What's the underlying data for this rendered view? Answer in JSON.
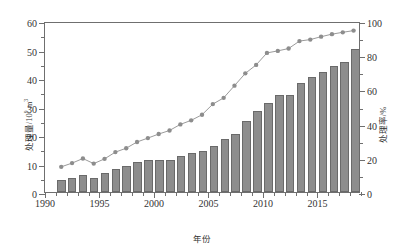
{
  "chart_data": {
    "type": "bar",
    "title": "",
    "xlabel": "年份",
    "ylabel": "处理量/10⁹ m³",
    "y2label": "处理率/%",
    "grid": false,
    "legend": "none",
    "xlim": [
      1990,
      2019
    ],
    "ylim": [
      0,
      60
    ],
    "y2lim": [
      0,
      100
    ],
    "ytick_labels": [
      "0",
      "10",
      "20",
      "30",
      "40",
      "50",
      "60"
    ],
    "ytick_values": [
      0,
      10,
      20,
      30,
      40,
      50,
      60
    ],
    "y2tick_labels": [
      "0",
      "20",
      "40",
      "60",
      "80",
      "100"
    ],
    "y2tick_values": [
      0,
      20,
      40,
      60,
      80,
      100
    ],
    "xtick_labels": [
      "1990",
      "1995",
      "2000",
      "2005",
      "2010",
      "2015"
    ],
    "xtick_values": [
      1990,
      1995,
      2000,
      2005,
      2010,
      2015
    ],
    "categories": [
      1991,
      1992,
      1993,
      1994,
      1995,
      1996,
      1997,
      1998,
      1999,
      2000,
      2001,
      2002,
      2003,
      2004,
      2005,
      2006,
      2007,
      2008,
      2009,
      2010,
      2011,
      2012,
      2013,
      2014,
      2015,
      2016,
      2017,
      2018
    ],
    "series": [
      {
        "name": "处理量",
        "type": "bar",
        "axis": "left",
        "unit": "10⁹ m³",
        "color": "#8d8d8d",
        "edge_color": "#6a6a6a",
        "values": [
          4.2,
          5.0,
          6.1,
          5.0,
          6.7,
          8.1,
          9.0,
          10.4,
          11.2,
          11.4,
          11.4,
          12.5,
          13.6,
          14.3,
          16.1,
          18.5,
          20.5,
          24.8,
          28.5,
          31.3,
          34.0,
          34.2,
          38.2,
          40.3,
          42.0,
          44.1,
          45.7,
          50.1
        ]
      },
      {
        "name": "处理率",
        "type": "line-marker",
        "axis": "right",
        "unit": "%",
        "color": "#8d8d8d",
        "marker": "circle",
        "values": [
          14.9,
          17.1,
          19.8,
          16.8,
          19.6,
          23.6,
          25.9,
          29.6,
          31.9,
          34.3,
          36.4,
          40.0,
          42.4,
          45.7,
          52.0,
          55.7,
          62.9,
          70.2,
          75.2,
          82.3,
          83.5,
          84.9,
          89.3,
          90.2,
          91.9,
          93.4,
          94.5,
          95.5
        ]
      }
    ]
  }
}
